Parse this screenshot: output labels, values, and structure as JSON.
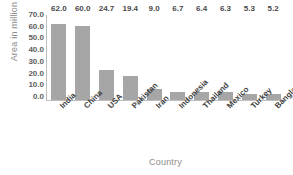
{
  "chart_data": {
    "type": "bar",
    "title": "",
    "xlabel": "Country",
    "ylabel": "Area in million ha",
    "categories": [
      "India",
      "China",
      "USA",
      "Pakistan",
      "Iran",
      "Indonesia",
      "Thailand",
      "Mexico",
      "Turkey",
      "Bangladesh"
    ],
    "values": [
      62.0,
      60.0,
      24.7,
      19.4,
      9.0,
      6.7,
      6.4,
      6.3,
      5.3,
      5.2
    ],
    "data_labels": [
      "62.0",
      "60.0",
      "24.7",
      "19.4",
      "9.0",
      "6.7",
      "6.4",
      "6.3",
      "5.3",
      "5.2"
    ],
    "ylim": [
      0,
      70
    ],
    "ytick_values": [
      70,
      60,
      50,
      40,
      30,
      20,
      10,
      0
    ],
    "ytick_labels": [
      "70.0",
      "60.0",
      "50.0",
      "40.0",
      "30.0",
      "20.0",
      "10.0",
      "0.0"
    ],
    "grid": false,
    "legend": "none",
    "bar_color": "#a6a6a6",
    "axis_color": "#bfbfbf",
    "axis_title_color": "#8c8c8c",
    "label_color": "#4a4a4a",
    "background": "#ffffff"
  }
}
